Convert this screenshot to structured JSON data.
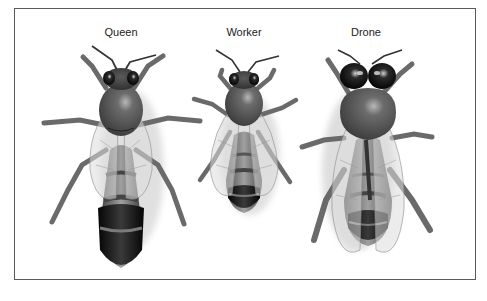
{
  "figure": {
    "panels": [
      {
        "id": "queen",
        "label": "Queen",
        "center_x": 121
      },
      {
        "id": "worker",
        "label": "Worker",
        "center_x": 244
      },
      {
        "id": "drone",
        "label": "Drone",
        "center_x": 366
      }
    ]
  },
  "colors": {
    "frame_border": "#5a5a5a",
    "background": "#ffffff",
    "body_dark": "#1a1a1a",
    "body_mid": "#6e6e6e",
    "body_light": "#9a9a9a",
    "leg": "#6a6a6a",
    "wing_fill": "#d8d8d8",
    "wing_vein": "#8a8a8a",
    "shadow": "#d6d6d6"
  }
}
